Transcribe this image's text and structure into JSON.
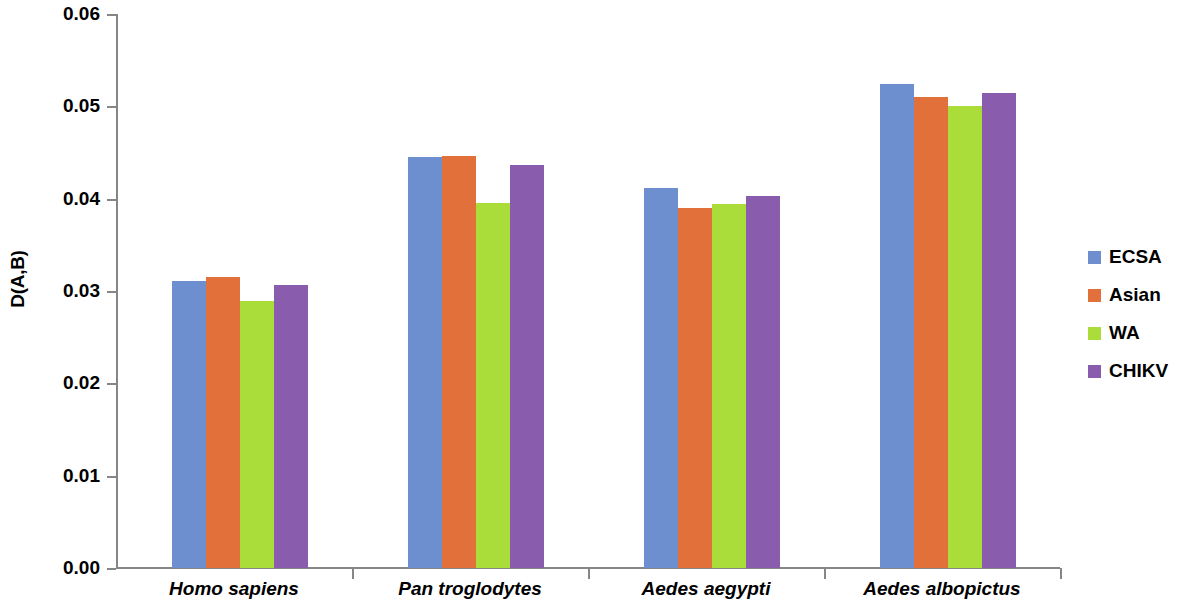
{
  "chart_data": {
    "type": "bar",
    "title": "",
    "subtitle": "",
    "xlabel": "",
    "ylabel": "D(A,B)",
    "ylim": [
      0.0,
      0.06
    ],
    "ytick_step": 0.01,
    "ytick_labels": [
      "0.06",
      "0.05",
      "0.04",
      "0.03",
      "0.02",
      "0.01",
      "0.00"
    ],
    "ytick_values": [
      0.06,
      0.05,
      0.04,
      0.03,
      0.02,
      0.01,
      0.0
    ],
    "grid": false,
    "legend_position": "right",
    "categories": [
      "Homo sapiens",
      "Pan troglodytes",
      "Aedes aegypti",
      "Aedes albopictus"
    ],
    "series": [
      {
        "name": "ECSA",
        "color": "#6d8fd0",
        "values": [
          0.0311,
          0.0445,
          0.0412,
          0.0524
        ]
      },
      {
        "name": "Asian",
        "color": "#e2703a",
        "values": [
          0.0315,
          0.0446,
          0.039,
          0.051
        ]
      },
      {
        "name": "WA",
        "color": "#aadd3a",
        "values": [
          0.0289,
          0.0395,
          0.0394,
          0.05
        ]
      },
      {
        "name": "CHIKV",
        "color": "#8a5cae",
        "values": [
          0.0307,
          0.0437,
          0.0403,
          0.0514
        ]
      }
    ]
  },
  "legend": {
    "items": [
      {
        "label": "ECSA",
        "color": "#6d8fd0"
      },
      {
        "label": "Asian",
        "color": "#e2703a"
      },
      {
        "label": "WA",
        "color": "#aadd3a"
      },
      {
        "label": "CHIKV",
        "color": "#8a5cae"
      }
    ]
  },
  "axis": {
    "y_title": "D(A,B)",
    "axis_color": "#868686"
  }
}
